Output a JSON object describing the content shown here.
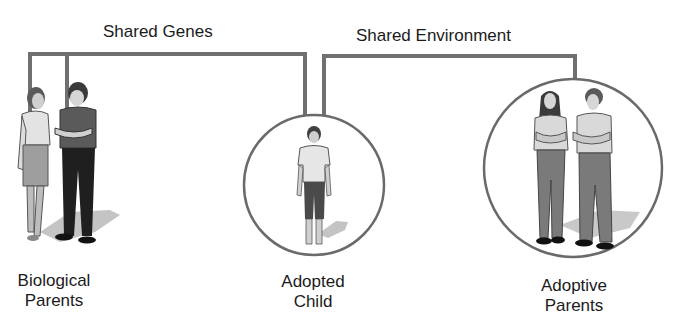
{
  "diagram": {
    "connectors": {
      "shared_genes": {
        "label": "Shared Genes"
      },
      "shared_environment": {
        "label": "Shared Environment"
      }
    },
    "groups": [
      {
        "id": "biological-parents",
        "line1": "Biological",
        "line2": "Parents"
      },
      {
        "id": "adopted-child",
        "line1": "Adopted",
        "line2": "Child"
      },
      {
        "id": "adoptive-parents",
        "line1": "Adoptive",
        "line2": "Parents"
      }
    ],
    "colors": {
      "line": "#6f6f6f",
      "circle": "#6a6a6a",
      "text": "#1b1b1b",
      "shadow": "#bdbdbd"
    }
  }
}
